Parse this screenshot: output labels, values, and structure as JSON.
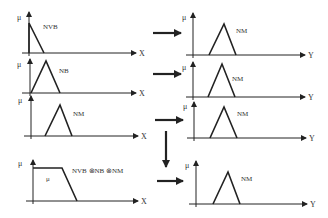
{
  "diagram": {
    "colors": {
      "stroke": "#222222",
      "text": "#333333",
      "background": "#ffffff"
    },
    "axis_labels": {
      "y": "μ",
      "x_input": "X",
      "x_output": "Y"
    },
    "left_panels": [
      {
        "label": "NVB",
        "shape": "right-triangle"
      },
      {
        "label": "NB",
        "shape": "triangle"
      },
      {
        "label": "NM",
        "shape": "triangle"
      },
      {
        "label": "NVB ⊗NB ⊗NM",
        "inner_label": "μ",
        "shape": "trapezoid"
      }
    ],
    "right_panels": [
      {
        "label": "NM"
      },
      {
        "label": "NM"
      },
      {
        "label": "NM"
      },
      {
        "label": "NM"
      }
    ]
  }
}
